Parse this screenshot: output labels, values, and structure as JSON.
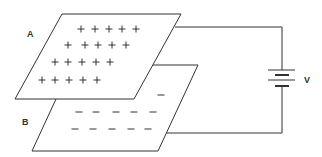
{
  "figure": {
    "type": "parallel-plate-capacitor",
    "labels": {
      "plate_a": "A",
      "plate_b": "B",
      "battery": "V"
    },
    "plate_a": {
      "charge_symbol": "+",
      "rows": [
        {
          "y": 29,
          "x": [
            81,
            95,
            109,
            122,
            136
          ]
        },
        {
          "y": 45,
          "x": [
            68,
            85,
            98,
            112,
            126
          ]
        },
        {
          "y": 62,
          "x": [
            55,
            68,
            82,
            96,
            110
          ]
        },
        {
          "y": 80,
          "x": [
            42,
            55,
            69,
            83,
            97
          ]
        }
      ]
    },
    "plate_b": {
      "charge_symbol": "–",
      "rows": [
        {
          "y": 95,
          "x": [
            161
          ]
        },
        {
          "y": 112,
          "x": [
            79,
            96,
            116,
            134,
            153
          ]
        },
        {
          "y": 129,
          "x": [
            75,
            93,
            112,
            131,
            148
          ]
        }
      ]
    },
    "colors": {
      "line": "#333333",
      "background": "#ffffff"
    }
  }
}
